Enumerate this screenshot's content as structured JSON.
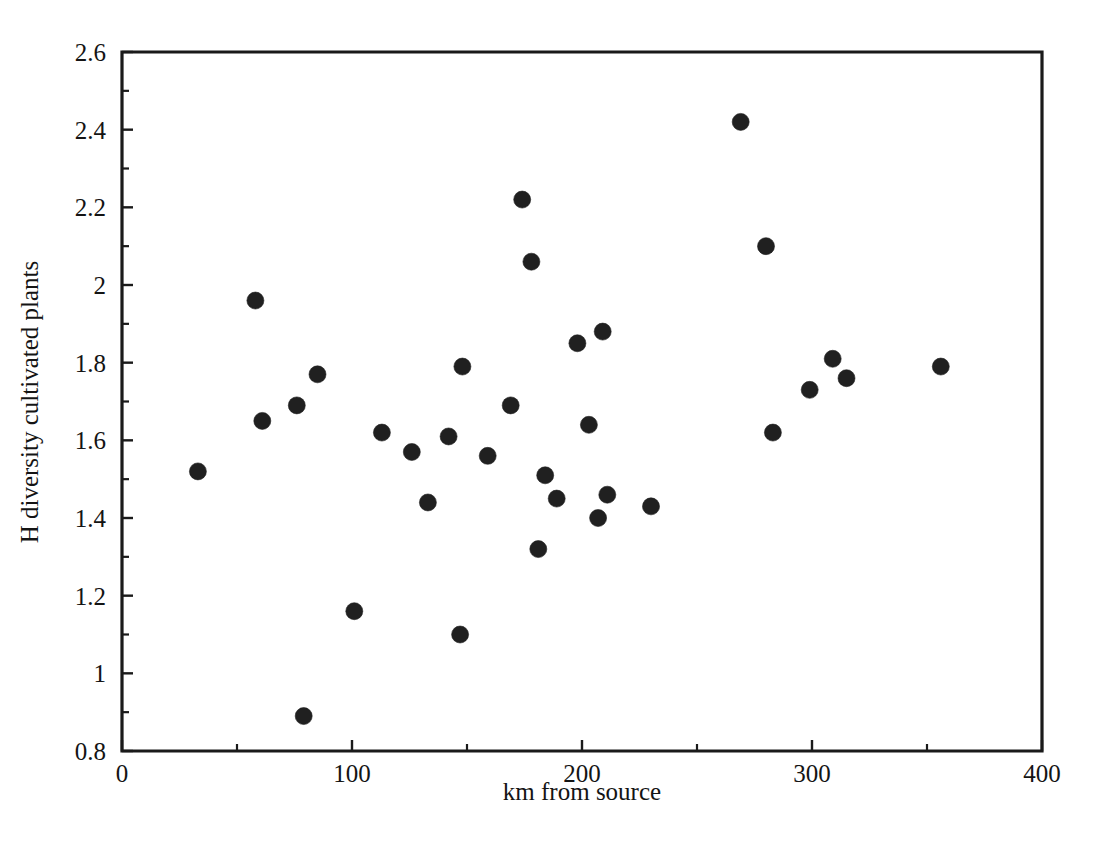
{
  "chart_data": {
    "type": "scatter",
    "title": "",
    "xlabel": "km from source",
    "ylabel": "H diversity cultivated plants",
    "xlim": [
      0,
      400
    ],
    "ylim": [
      0.8,
      2.6
    ],
    "grid": false,
    "legend": "none",
    "x_ticks": [
      0,
      100,
      200,
      300,
      400
    ],
    "x_tick_labels": [
      "0",
      "100",
      "200",
      "300",
      "400"
    ],
    "x_minor_ticks": [
      50,
      150,
      250,
      350
    ],
    "y_ticks": [
      0.8,
      1,
      1.2,
      1.4,
      1.6,
      1.8,
      2,
      2.2,
      2.4,
      2.6
    ],
    "y_tick_labels": [
      "0.8",
      "1",
      "1.2",
      "1.4",
      "1.6",
      "1.8",
      "2",
      "2.2",
      "2.4",
      "2.6"
    ],
    "y_minor_ticks": [
      0.9,
      1.1,
      1.3,
      1.5,
      1.7,
      1.9,
      2.1,
      2.3,
      2.5
    ],
    "marker": {
      "shape": "circle",
      "color": "#202020",
      "size_px": 17
    },
    "points": [
      {
        "x": 33,
        "y": 1.52
      },
      {
        "x": 58,
        "y": 1.96
      },
      {
        "x": 61,
        "y": 1.65
      },
      {
        "x": 76,
        "y": 1.69
      },
      {
        "x": 79,
        "y": 0.89
      },
      {
        "x": 85,
        "y": 1.77
      },
      {
        "x": 101,
        "y": 1.16
      },
      {
        "x": 113,
        "y": 1.62
      },
      {
        "x": 126,
        "y": 1.57
      },
      {
        "x": 133,
        "y": 1.44
      },
      {
        "x": 142,
        "y": 1.61
      },
      {
        "x": 147,
        "y": 1.1
      },
      {
        "x": 148,
        "y": 1.79
      },
      {
        "x": 159,
        "y": 1.56
      },
      {
        "x": 169,
        "y": 1.69
      },
      {
        "x": 174,
        "y": 2.22
      },
      {
        "x": 178,
        "y": 2.06
      },
      {
        "x": 181,
        "y": 1.32
      },
      {
        "x": 184,
        "y": 1.51
      },
      {
        "x": 189,
        "y": 1.45
      },
      {
        "x": 198,
        "y": 1.85
      },
      {
        "x": 203,
        "y": 1.64
      },
      {
        "x": 207,
        "y": 1.4
      },
      {
        "x": 209,
        "y": 1.88
      },
      {
        "x": 211,
        "y": 1.46
      },
      {
        "x": 230,
        "y": 1.43
      },
      {
        "x": 269,
        "y": 2.42
      },
      {
        "x": 280,
        "y": 2.1
      },
      {
        "x": 283,
        "y": 1.62
      },
      {
        "x": 299,
        "y": 1.73
      },
      {
        "x": 309,
        "y": 1.81
      },
      {
        "x": 315,
        "y": 1.76
      },
      {
        "x": 356,
        "y": 1.79
      }
    ]
  },
  "plot_geometry": {
    "left_px": 122,
    "right_px": 1042,
    "top_px": 52,
    "bottom_px": 751
  }
}
